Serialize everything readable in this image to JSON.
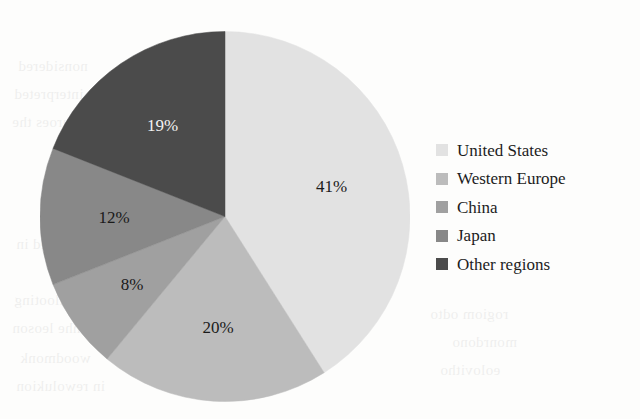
{
  "chart_data": {
    "type": "pie",
    "title": "",
    "xlabel": "",
    "ylabel": "",
    "categories": [
      "United States",
      "Western Europe",
      "China",
      "Japan",
      "Other regions"
    ],
    "values": [
      41,
      20,
      8,
      12,
      19
    ],
    "value_labels": [
      "41%",
      "20%",
      "8%",
      "12%",
      "19%"
    ],
    "unit": "%",
    "total": 100,
    "start_angle_deg": 0,
    "direction": "clockwise",
    "grid": false,
    "legend_position": "right",
    "colors": [
      "#e2e2e2",
      "#bcbcbc",
      "#a0a0a0",
      "#888888",
      "#4b4b4b"
    ],
    "label_colors": [
      "#1a1a1a",
      "#1a1a1a",
      "#1a1a1a",
      "#1a1a1a",
      "#f2f2f2"
    ],
    "slices": [
      {
        "name": "United States",
        "value": 41,
        "label": "41%",
        "color": "#e2e2e2",
        "label_color": "#1a1a1a"
      },
      {
        "name": "Western Europe",
        "value": 20,
        "label": "20%",
        "color": "#bcbcbc",
        "label_color": "#1a1a1a"
      },
      {
        "name": "China",
        "value": 8,
        "label": "8%",
        "color": "#a0a0a0",
        "label_color": "#1a1a1a"
      },
      {
        "name": "Japan",
        "value": 12,
        "label": "12%",
        "color": "#888888",
        "label_color": "#1a1a1a"
      },
      {
        "name": "Other regions",
        "value": 19,
        "label": "19%",
        "color": "#4b4b4b",
        "label_color": "#f2f2f2"
      }
    ]
  },
  "legend": {
    "items": [
      {
        "label": "United States",
        "color": "#e2e2e2"
      },
      {
        "label": "Western Europe",
        "color": "#bcbcbc"
      },
      {
        "label": "China",
        "color": "#a0a0a0"
      },
      {
        "label": "Japan",
        "color": "#888888"
      },
      {
        "label": "Other regions",
        "color": "#4b4b4b"
      }
    ]
  },
  "background": {
    "page_color": "#fdfdfc",
    "bleed_text": [
      {
        "text": "nonsidered",
        "x": 18,
        "y": 58
      },
      {
        "text": "interpreted",
        "x": 14,
        "y": 86
      },
      {
        "text": "seouroes the",
        "x": 12,
        "y": 114
      },
      {
        "text": "reoorded in",
        "x": 16,
        "y": 236
      },
      {
        "text": "nollooting",
        "x": 14,
        "y": 292
      },
      {
        "text": "nhe leoson",
        "x": 12,
        "y": 320
      },
      {
        "text": "woodmonk",
        "x": 20,
        "y": 350
      },
      {
        "text": "in rewolukion",
        "x": 16,
        "y": 378
      },
      {
        "text": "rogiom odto",
        "x": 430,
        "y": 306
      },
      {
        "text": "monrdono",
        "x": 452,
        "y": 334
      },
      {
        "text": "eolovitho",
        "x": 440,
        "y": 362
      }
    ]
  }
}
